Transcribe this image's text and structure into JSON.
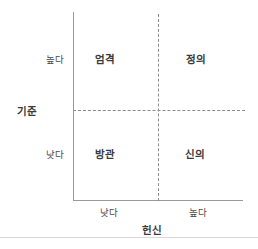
{
  "chart_data": {
    "type": "scatter",
    "title": "",
    "xlabel": "헌신",
    "ylabel": "기준",
    "grid": false,
    "legend": "none",
    "x_ticks": [
      "낮다",
      "높다"
    ],
    "y_ticks": [
      "높다",
      "낮다"
    ],
    "quadrants": [
      {
        "position": "top-left",
        "label": "엄격",
        "x": "낮다",
        "y": "높다"
      },
      {
        "position": "top-right",
        "label": "정의",
        "x": "높다",
        "y": "높다"
      },
      {
        "position": "bottom-left",
        "label": "방관",
        "x": "낮다",
        "y": "낮다"
      },
      {
        "position": "bottom-right",
        "label": "신의",
        "x": "높다",
        "y": "낮다"
      }
    ]
  },
  "axes": {
    "y_title": "기준",
    "x_title": "헌신",
    "y_tick_high": "높다",
    "y_tick_low": "낮다",
    "x_tick_low": "낮다",
    "x_tick_high": "높다"
  },
  "quadrant_labels": {
    "top_left": "엄격",
    "top_right": "정의",
    "bottom_left": "방관",
    "bottom_right": "신의"
  },
  "colors": {
    "axis_line": "#9a9a9a",
    "divider_line": "#8c8c8c",
    "label_text": "#3a3a3a",
    "tick_text": "#4a4a4a",
    "bottom_rule": "#d8d8d8",
    "background": "#ffffff"
  }
}
